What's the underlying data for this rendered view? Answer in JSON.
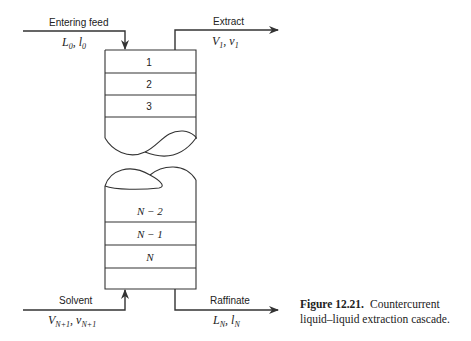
{
  "diagram": {
    "streams": {
      "feed": {
        "label": "Entering feed",
        "symbol_main": "L",
        "symbol_main_sub": "0",
        "symbol_sep": ", ",
        "symbol_minor": "l",
        "symbol_minor_sub": "0"
      },
      "extract": {
        "label": "Extract",
        "symbol_main": "V",
        "symbol_main_sub": "1",
        "symbol_sep": ", ",
        "symbol_minor": "v",
        "symbol_minor_sub": "1"
      },
      "solvent": {
        "label": "Solvent",
        "symbol_main": "V",
        "symbol_main_sub": "N+1",
        "symbol_sep": ", ",
        "symbol_minor": "v",
        "symbol_minor_sub": "N+1"
      },
      "raffinate": {
        "label": "Raffinate",
        "symbol_main": "L",
        "symbol_main_sub": "N",
        "symbol_sep": ", ",
        "symbol_minor": "l",
        "symbol_minor_sub": "N"
      }
    },
    "stages_top": [
      "1",
      "2",
      "3"
    ],
    "stages_bottom": [
      "N − 2",
      "N − 1",
      "N"
    ],
    "line_color": "#333333"
  },
  "caption": {
    "figure_label": "Figure 12.21.",
    "text": "Countercurrent liquid–liquid extraction cascade."
  }
}
